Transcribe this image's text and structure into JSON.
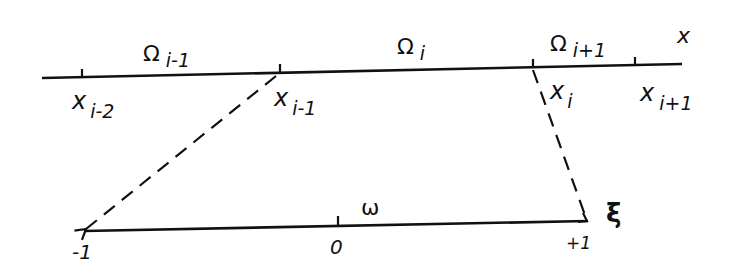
{
  "diagram": {
    "type": "element-mapping",
    "global_axis": {
      "label": "x",
      "nodes": [
        {
          "base": "x",
          "sub": "i-2"
        },
        {
          "base": "x",
          "sub": "i-1"
        },
        {
          "base": "x",
          "sub": "i"
        },
        {
          "base": "x",
          "sub": "i+1"
        }
      ],
      "elements": [
        {
          "base": "Ω",
          "sub": "i-1"
        },
        {
          "base": "Ω",
          "sub": "i"
        },
        {
          "base": "Ω",
          "sub": "i+1"
        }
      ]
    },
    "reference_axis": {
      "label": "ξ",
      "element_label": "ω",
      "ticks": [
        "-1",
        "0",
        "+1"
      ]
    },
    "mappings": [
      {
        "from": "x_{i-1}",
        "to": "-1",
        "style": "dashed-arrow"
      },
      {
        "from": "x_i",
        "to": "+1",
        "style": "dashed-arrow"
      }
    ]
  },
  "labels": {
    "x_axis": "x",
    "xi_axis": "ξ",
    "omega_small": "ω",
    "Omega": "Ω",
    "x": "x",
    "sub_im2": "i-2",
    "sub_im1": "i-1",
    "sub_i": "i",
    "sub_ip1": "i+1",
    "tick_m1": "-1",
    "tick_0": "0",
    "tick_p1": "+1"
  }
}
